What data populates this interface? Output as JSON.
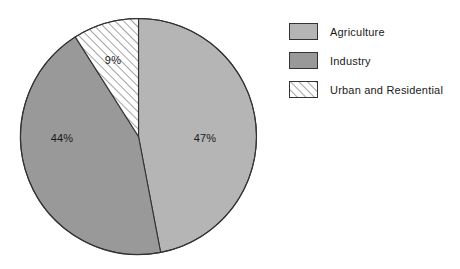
{
  "chart_data": {
    "type": "pie",
    "title": "",
    "subtitle": "",
    "xlabel": "",
    "ylabel": "",
    "categories": [
      "Agriculture",
      "Industry",
      "Urban and Residential"
    ],
    "values": [
      47,
      44,
      9
    ],
    "unit": "%",
    "data_labels": [
      "47%",
      "44%",
      "9%"
    ],
    "start_angle_deg": 0,
    "direction": "clockwise",
    "legend_position": "right",
    "grid": false,
    "slices": [
      {
        "name": "Agriculture",
        "value": 47,
        "label": "47%",
        "fill": "#b5b5b5",
        "pattern": "solid",
        "stroke": "#333333",
        "label_x": 205,
        "label_y": 138
      },
      {
        "name": "Industry",
        "value": 44,
        "label": "44%",
        "fill": "#999999",
        "pattern": "solid",
        "stroke": "#333333",
        "label_x": 62,
        "label_y": 138
      },
      {
        "name": "Urban and Residential",
        "value": 9,
        "label": "9%",
        "fill": "#ffffff",
        "pattern": "diagonal-hatch",
        "stroke": "#333333",
        "label_x": 113,
        "label_y": 60
      }
    ]
  },
  "pie": {
    "center_x": 138.5,
    "center_y": 136.5,
    "radius": 118,
    "outline_color": "#333333",
    "label_47": "47%",
    "label_44": "44%",
    "label_9": "9%"
  },
  "legend": {
    "items": [
      {
        "label": "Agriculture",
        "fill": "#b5b5b5",
        "pattern": "solid"
      },
      {
        "label": "Industry",
        "fill": "#999999",
        "pattern": "solid"
      },
      {
        "label": "Urban and Residential",
        "fill": "#ffffff",
        "pattern": "diagonal-hatch"
      }
    ]
  }
}
